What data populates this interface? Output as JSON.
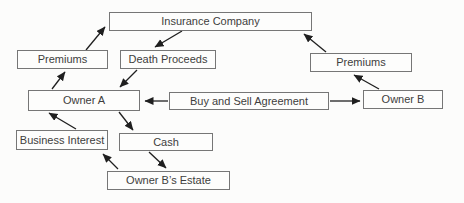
{
  "diagram": {
    "type": "flowchart",
    "nodes": {
      "insurance_company": {
        "label": "Insurance Company"
      },
      "premiums_left": {
        "label": "Premiums"
      },
      "death_proceeds": {
        "label": "Death Proceeds"
      },
      "premiums_right": {
        "label": "Premiums"
      },
      "owner_a": {
        "label": "Owner A"
      },
      "buy_sell": {
        "label": "Buy and Sell Agreement"
      },
      "owner_b": {
        "label": "Owner B"
      },
      "business_interest": {
        "label": "Business Interest"
      },
      "cash": {
        "label": "Cash"
      },
      "owner_b_estate": {
        "label": "Owner B’s Estate"
      }
    },
    "edges": [
      {
        "from": "Owner A",
        "to": "Premiums (left)"
      },
      {
        "from": "Premiums (left)",
        "to": "Insurance Company"
      },
      {
        "from": "Insurance Company",
        "to": "Death Proceeds"
      },
      {
        "from": "Death Proceeds",
        "to": "Owner A"
      },
      {
        "from": "Buy and Sell Agreement",
        "to": "Owner A"
      },
      {
        "from": "Buy and Sell Agreement",
        "to": "Owner B"
      },
      {
        "from": "Owner B",
        "to": "Premiums (right)"
      },
      {
        "from": "Premiums (right)",
        "to": "Insurance Company"
      },
      {
        "from": "Business Interest",
        "to": "Owner A"
      },
      {
        "from": "Owner A",
        "to": "Cash"
      },
      {
        "from": "Cash",
        "to": "Owner B’s Estate"
      },
      {
        "from": "Owner B’s Estate",
        "to": "Business Interest"
      }
    ],
    "colors": {
      "background": "#fcfcfb",
      "box_fill": "#fdfdfc",
      "box_border": "#767676",
      "text": "#3d3d3d",
      "arrow": "#1f1f1f"
    }
  }
}
